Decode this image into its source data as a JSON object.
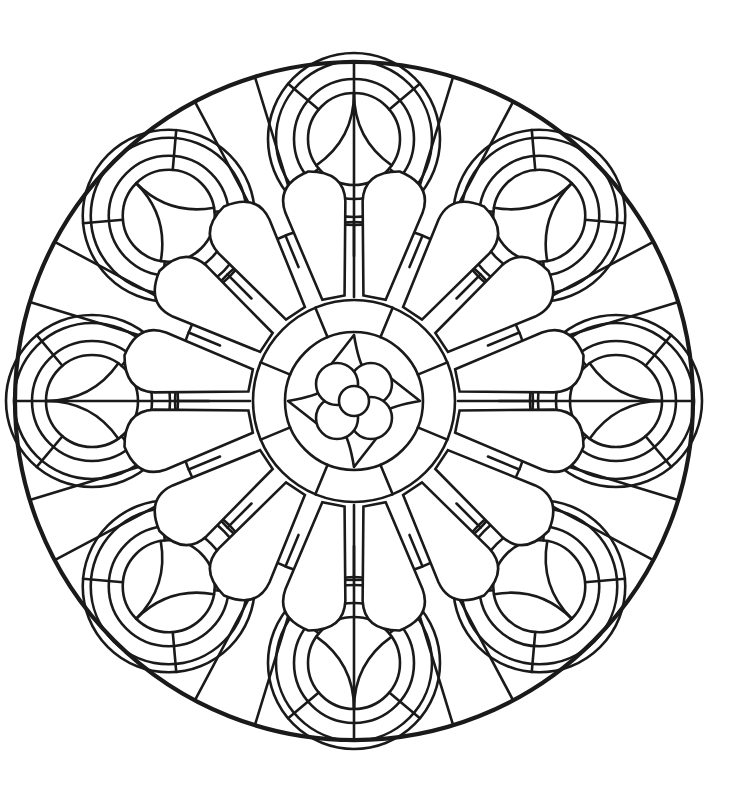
{
  "artwork": {
    "title": "Stained-glass rose window coloring page",
    "type": "line-art mandala",
    "colors": {
      "background": "#ffffff",
      "line": "#1a1a1a"
    },
    "symmetry": 8,
    "center": [
      354,
      401
    ],
    "outer_frame_radius": 339,
    "center_medallion": {
      "radius": 95,
      "core_circle_radius": 15,
      "quatrefoil_circle_radius": 21,
      "quatrefoil_offset": 24,
      "vesica_reach": 66
    },
    "petal_ring": {
      "count": 16,
      "inner_radius": 100,
      "outer_radius": 228,
      "tile_radius": 175
    },
    "outer_roundels": {
      "count": 8,
      "center_radius": 262,
      "ring_radii": [
        78,
        60,
        46
      ]
    }
  }
}
